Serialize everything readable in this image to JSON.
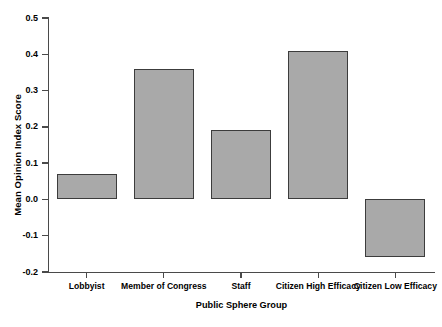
{
  "chart_data": {
    "type": "bar",
    "title": "",
    "subtitle": "",
    "xlabel": "Public Sphere Group",
    "ylabel": "Mean Opinion Index Score",
    "categories": [
      "Lobbyist",
      "Member of Congress",
      "Staff",
      "Citizen High Efficacy",
      "Citizen Low Efficacy"
    ],
    "values": [
      0.07,
      0.36,
      0.19,
      0.41,
      -0.16
    ],
    "ylim": [
      -0.2,
      0.5
    ],
    "ytick_labels": [
      "0.5",
      "0.4",
      "0.3",
      "0.2",
      "0.1",
      "0.0",
      "-0.1",
      "-0.2"
    ],
    "ytick_values": [
      0.5,
      0.4,
      0.3,
      0.2,
      0.1,
      0.0,
      -0.1,
      -0.2
    ],
    "grid": false,
    "legend": null,
    "legend_position": "none",
    "bar_fill_color": "#a9a9a9",
    "bar_edge_color": "#3c3c3c",
    "axis_color": "#4a4a4a",
    "background_color": "#ffffff"
  }
}
